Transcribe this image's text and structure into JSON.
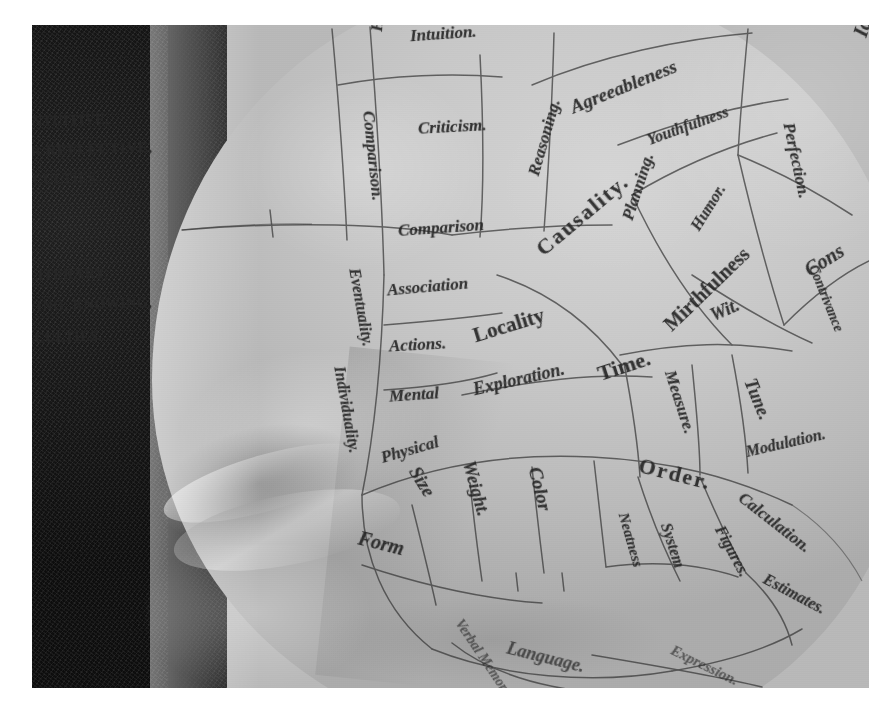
{
  "image": {
    "subject": "phrenology-head-bust",
    "description": "Close-up photograph of a ceramic phrenology head showing the forehead and eye region with labelled faculty regions",
    "palette": {
      "backdrop": "#151413",
      "plaster_light": "#d6d4cd",
      "plaster_mid": "#c9c7c0",
      "plaster_shadow": "#adaba4",
      "ink": "#2a2723",
      "frame": "#ffffff"
    }
  },
  "group_headings": [
    {
      "id": "intuitive",
      "text": "INTUITIVE,",
      "note": "partially cropped at left edge"
    },
    {
      "id": "reflective",
      "text": "OR REFLECTIVE,",
      "note": "partially cropped at left edge"
    },
    {
      "id": "faculties1",
      "text": "FACULTIES.",
      "note": "partially cropped at left edge"
    },
    {
      "id": "literary",
      "text": "LITERARY,",
      "note": "partially cropped at left edge"
    },
    {
      "id": "perceiving",
      "text": "PERCEIVING, KNOWING,",
      "note": "partially cropped at left edge"
    },
    {
      "id": "faculties2",
      "text": "FACULTIES.",
      "note": "partially cropped at left edge"
    }
  ],
  "regions": [
    {
      "id": "human-nature",
      "label": "Hum",
      "full": "Human Nature",
      "orientation": "vertical"
    },
    {
      "id": "intuition",
      "label": "Intuition.",
      "orientation": "horizontal"
    },
    {
      "id": "agreeableness",
      "label": "Agreeableness",
      "orientation": "arc"
    },
    {
      "id": "youthfulness",
      "label": "Youthfulness",
      "orientation": "arc"
    },
    {
      "id": "ideality",
      "label": "Id",
      "full": "Ideality",
      "orientation": "vertical"
    },
    {
      "id": "perfection",
      "label": "Perfection.",
      "orientation": "vertical"
    },
    {
      "id": "criticism",
      "label": "Criticism.",
      "orientation": "horizontal"
    },
    {
      "id": "comparison-major",
      "label": "Comparison.",
      "orientation": "vertical"
    },
    {
      "id": "comparison-minor",
      "label": "Comparison",
      "orientation": "horizontal"
    },
    {
      "id": "reasoning",
      "label": "Reasoning.",
      "orientation": "diagonal"
    },
    {
      "id": "causality",
      "label": "Causality.",
      "orientation": "diagonal"
    },
    {
      "id": "planning",
      "label": "Planning.",
      "orientation": "diagonal"
    },
    {
      "id": "humor",
      "label": "Humor.",
      "orientation": "diagonal"
    },
    {
      "id": "mirthfulness",
      "label": "Mirthfulness",
      "orientation": "diagonal"
    },
    {
      "id": "wit",
      "label": "Wit.",
      "orientation": "diagonal"
    },
    {
      "id": "constructiveness",
      "label": "Cons",
      "full": "Constructiveness",
      "orientation": "diagonal"
    },
    {
      "id": "contrivance",
      "label": "Contrivance",
      "orientation": "diagonal"
    },
    {
      "id": "eventuality",
      "label": "Eventuality.",
      "orientation": "vertical"
    },
    {
      "id": "association",
      "label": "Association",
      "orientation": "horizontal"
    },
    {
      "id": "actions",
      "label": "Actions.",
      "orientation": "horizontal"
    },
    {
      "id": "mental",
      "label": "Mental",
      "orientation": "horizontal"
    },
    {
      "id": "physical",
      "label": "Physical",
      "orientation": "diagonal"
    },
    {
      "id": "individuality",
      "label": "Individuality.",
      "orientation": "vertical"
    },
    {
      "id": "locality",
      "label": "Locality",
      "orientation": "diagonal"
    },
    {
      "id": "exploration",
      "label": "Exploration.",
      "orientation": "diagonal"
    },
    {
      "id": "time",
      "label": "Time.",
      "orientation": "diagonal"
    },
    {
      "id": "measure",
      "label": "Measure.",
      "orientation": "vertical"
    },
    {
      "id": "tune",
      "label": "Tune.",
      "orientation": "vertical"
    },
    {
      "id": "modulation",
      "label": "Modulation.",
      "orientation": "arc"
    },
    {
      "id": "size",
      "label": "Size",
      "orientation": "vertical"
    },
    {
      "id": "weight",
      "label": "Weight.",
      "orientation": "vertical"
    },
    {
      "id": "color",
      "label": "Color",
      "orientation": "vertical"
    },
    {
      "id": "order",
      "label": "Order.",
      "orientation": "arc"
    },
    {
      "id": "neatness",
      "label": "Neatness",
      "orientation": "vertical"
    },
    {
      "id": "system",
      "label": "System",
      "orientation": "vertical"
    },
    {
      "id": "figures",
      "label": "Figures.",
      "orientation": "vertical"
    },
    {
      "id": "calculation",
      "label": "Calculation.",
      "orientation": "arc"
    },
    {
      "id": "estimates",
      "label": "Estimates.",
      "orientation": "arc"
    },
    {
      "id": "form",
      "label": "Form",
      "orientation": "arc"
    },
    {
      "id": "verbal-memory",
      "label": "Verbal Memory",
      "orientation": "arc"
    },
    {
      "id": "language",
      "label": "Language.",
      "orientation": "arc"
    },
    {
      "id": "expression",
      "label": "Expression.",
      "orientation": "arc"
    }
  ]
}
